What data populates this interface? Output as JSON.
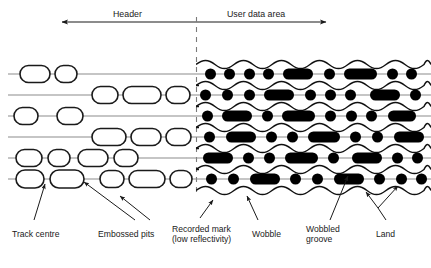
{
  "figure": {
    "header_labels": [
      {
        "id": "header",
        "text": "Header",
        "x": 113,
        "y": 9
      },
      {
        "id": "user-data-area",
        "text": "User data area",
        "x": 227,
        "y": 9
      }
    ],
    "span_arrow": {
      "x1": 62,
      "x2": 326,
      "y": 22,
      "style": "double-headed"
    },
    "divider": {
      "x": 196,
      "y1": 17,
      "y2": 196,
      "style": "dashed"
    },
    "callouts": [
      {
        "id": "track-centre",
        "lines": [
          "Track centre"
        ],
        "x": 12,
        "y": 229
      },
      {
        "id": "embossed-pits",
        "lines": [
          "Embossed pits"
        ],
        "x": 98,
        "y": 229
      },
      {
        "id": "recorded-mark",
        "lines": [
          "Recorded mark",
          "(low reflectivity)"
        ],
        "x": 172,
        "y": 224
      },
      {
        "id": "wobble",
        "lines": [
          "Wobble"
        ],
        "x": 252,
        "y": 229
      },
      {
        "id": "wobbled-groove",
        "lines": [
          "Wobbled",
          "groove"
        ],
        "x": 306,
        "y": 224
      },
      {
        "id": "land",
        "lines": [
          "Land"
        ],
        "x": 376,
        "y": 229
      }
    ],
    "regions": {
      "header_region": {
        "x1": 8,
        "x2": 196,
        "description": "straight track lines with white embossed pits"
      },
      "user_region": {
        "x1": 196,
        "x2": 428,
        "description": "wobbled grooves with black recorded marks"
      }
    },
    "track_lines_y": [
      74,
      95,
      116,
      137,
      158,
      179
    ],
    "colors": {
      "ink": "#1a1a1a",
      "track_line": "#8b8b8b",
      "pit_fill": "#ffffff",
      "pit_stroke": "#1a1a1a",
      "mark_fill": "#000000",
      "divider": "#7a7a7a",
      "background": "#ffffff"
    },
    "pits": [
      {
        "track": 0,
        "x": 20,
        "w": 30,
        "h": 17
      },
      {
        "track": 0,
        "x": 55,
        "w": 22,
        "h": 17
      },
      {
        "track": 1,
        "x": 92,
        "w": 26,
        "h": 17
      },
      {
        "track": 1,
        "x": 123,
        "w": 38,
        "h": 17
      },
      {
        "track": 1,
        "x": 166,
        "w": 24,
        "h": 17
      },
      {
        "track": 2,
        "x": 14,
        "w": 24,
        "h": 17
      },
      {
        "track": 2,
        "x": 57,
        "w": 26,
        "h": 17
      },
      {
        "track": 3,
        "x": 92,
        "w": 34,
        "h": 17
      },
      {
        "track": 3,
        "x": 131,
        "w": 30,
        "h": 17
      },
      {
        "track": 3,
        "x": 166,
        "w": 25,
        "h": 17
      },
      {
        "track": 4,
        "x": 16,
        "w": 26,
        "h": 17
      },
      {
        "track": 4,
        "x": 48,
        "w": 22,
        "h": 17
      },
      {
        "track": 4,
        "x": 78,
        "w": 30,
        "h": 17
      },
      {
        "track": 4,
        "x": 114,
        "w": 24,
        "h": 17
      },
      {
        "track": 5,
        "x": 16,
        "w": 28,
        "h": 18
      },
      {
        "track": 5,
        "x": 50,
        "w": 34,
        "h": 18
      },
      {
        "track": 5,
        "x": 100,
        "w": 24,
        "h": 17
      },
      {
        "track": 5,
        "x": 129,
        "w": 36,
        "h": 17
      },
      {
        "track": 5,
        "x": 170,
        "w": 22,
        "h": 17
      }
    ],
    "marks": [
      {
        "track": 0,
        "x": 205,
        "w": 11
      },
      {
        "track": 0,
        "x": 224,
        "w": 11
      },
      {
        "track": 0,
        "x": 244,
        "w": 11
      },
      {
        "track": 0,
        "x": 263,
        "w": 11
      },
      {
        "track": 0,
        "x": 283,
        "w": 30
      },
      {
        "track": 0,
        "x": 324,
        "w": 11
      },
      {
        "track": 0,
        "x": 344,
        "w": 33
      },
      {
        "track": 0,
        "x": 387,
        "w": 11
      },
      {
        "track": 0,
        "x": 406,
        "w": 11
      },
      {
        "track": 1,
        "x": 200,
        "w": 11
      },
      {
        "track": 1,
        "x": 222,
        "w": 11
      },
      {
        "track": 1,
        "x": 244,
        "w": 11
      },
      {
        "track": 1,
        "x": 264,
        "w": 30
      },
      {
        "track": 1,
        "x": 305,
        "w": 11
      },
      {
        "track": 1,
        "x": 325,
        "w": 11
      },
      {
        "track": 1,
        "x": 345,
        "w": 11
      },
      {
        "track": 1,
        "x": 370,
        "w": 30
      },
      {
        "track": 1,
        "x": 410,
        "w": 11
      },
      {
        "track": 2,
        "x": 202,
        "w": 11
      },
      {
        "track": 2,
        "x": 222,
        "w": 30
      },
      {
        "track": 2,
        "x": 262,
        "w": 11
      },
      {
        "track": 2,
        "x": 282,
        "w": 33
      },
      {
        "track": 2,
        "x": 325,
        "w": 11
      },
      {
        "track": 2,
        "x": 346,
        "w": 11
      },
      {
        "track": 2,
        "x": 366,
        "w": 11
      },
      {
        "track": 2,
        "x": 388,
        "w": 28
      },
      {
        "track": 3,
        "x": 204,
        "w": 11
      },
      {
        "track": 3,
        "x": 226,
        "w": 30
      },
      {
        "track": 3,
        "x": 266,
        "w": 11
      },
      {
        "track": 3,
        "x": 287,
        "w": 11
      },
      {
        "track": 3,
        "x": 308,
        "w": 32
      },
      {
        "track": 3,
        "x": 350,
        "w": 11
      },
      {
        "track": 3,
        "x": 372,
        "w": 11
      },
      {
        "track": 3,
        "x": 394,
        "w": 30
      },
      {
        "track": 4,
        "x": 203,
        "w": 30
      },
      {
        "track": 4,
        "x": 243,
        "w": 11
      },
      {
        "track": 4,
        "x": 264,
        "w": 11
      },
      {
        "track": 4,
        "x": 285,
        "w": 33
      },
      {
        "track": 4,
        "x": 328,
        "w": 11
      },
      {
        "track": 4,
        "x": 352,
        "w": 30
      },
      {
        "track": 4,
        "x": 392,
        "w": 11
      },
      {
        "track": 4,
        "x": 412,
        "w": 11
      },
      {
        "track": 5,
        "x": 206,
        "w": 11
      },
      {
        "track": 5,
        "x": 228,
        "w": 11
      },
      {
        "track": 5,
        "x": 250,
        "w": 30
      },
      {
        "track": 5,
        "x": 290,
        "w": 11
      },
      {
        "track": 5,
        "x": 312,
        "w": 11
      },
      {
        "track": 5,
        "x": 334,
        "w": 30
      },
      {
        "track": 5,
        "x": 374,
        "w": 11
      },
      {
        "track": 5,
        "x": 396,
        "w": 11
      },
      {
        "track": 5,
        "x": 416,
        "w": 11
      }
    ]
  }
}
